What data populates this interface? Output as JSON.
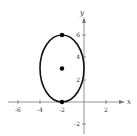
{
  "diagram": {
    "type": "ellipse-graph",
    "axes": {
      "x_label": "x",
      "y_label": "y",
      "x_ticks": [
        {
          "value": -6,
          "label": "-6"
        },
        {
          "value": -4,
          "label": "-4"
        },
        {
          "value": -2,
          "label": "-2"
        },
        {
          "value": 2,
          "label": "2"
        }
      ],
      "y_ticks": [
        {
          "value": 6,
          "label": "6"
        },
        {
          "value": 4,
          "label": "4"
        },
        {
          "value": 2,
          "label": "2"
        },
        {
          "value": -2,
          "label": "-2"
        }
      ],
      "x_range": [
        -7,
        3
      ],
      "y_range": [
        -3,
        8
      ]
    },
    "ellipse": {
      "center": [
        -2,
        3
      ],
      "semi_axis_x": 2,
      "semi_axis_y": 3,
      "stroke_color": "#111111"
    },
    "points": [
      {
        "name": "top-vertex",
        "x": -2,
        "y": 6
      },
      {
        "name": "center",
        "x": -2,
        "y": 3
      },
      {
        "name": "bottom-vertex",
        "x": -2,
        "y": 0
      }
    ]
  }
}
